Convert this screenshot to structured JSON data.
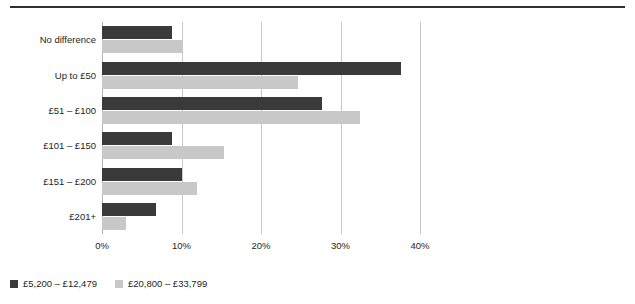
{
  "chart_data": {
    "type": "bar",
    "orientation": "horizontal",
    "title": "",
    "subtitle": "",
    "xlabel": "",
    "ylabel": "",
    "xlim": [
      0,
      40
    ],
    "xticks": [
      0,
      10,
      20,
      30,
      40
    ],
    "xtick_labels": [
      "0%",
      "10%",
      "20%",
      "30%",
      "40%"
    ],
    "grid": "vertical",
    "legend_position": "bottom-left",
    "categories": [
      "No difference",
      "Up to £50",
      "£51 – £100",
      "£101 – £150",
      "£151 – £200",
      "£201+"
    ],
    "series": [
      {
        "name": "£5,200 – £12,479",
        "color": "#3a3a3a",
        "values": [
          8.8,
          37.6,
          27.7,
          8.8,
          10.0,
          6.8
        ]
      },
      {
        "name": "£20,800 – £33,799",
        "color": "#c8c8c8",
        "values": [
          10.0,
          24.7,
          32.5,
          15.4,
          11.9,
          3.0
        ]
      }
    ]
  },
  "legend": {
    "items": [
      {
        "label": "£5,200 – £12,479",
        "color": "#3a3a3a"
      },
      {
        "label": "£20,800 – £33,799",
        "color": "#c8c8c8"
      }
    ]
  },
  "colors": {
    "series_dark": "#3a3a3a",
    "series_light": "#c8c8c8",
    "gridline": "#c9c9c9",
    "rule": "#2f2f2f",
    "text": "#231f20",
    "background": "#ffffff"
  }
}
